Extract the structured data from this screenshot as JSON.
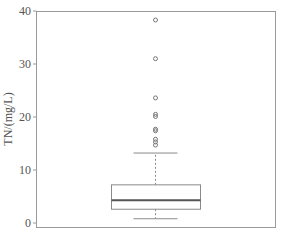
{
  "chart_data": {
    "type": "box",
    "title": "",
    "xlabel": "",
    "ylabel": "TN/(mg/L)",
    "ylim": [
      0,
      40
    ],
    "yticks": [
      0,
      10,
      20,
      30,
      40
    ],
    "ytick_labels": [
      "0",
      "10",
      "20",
      "30",
      "40"
    ],
    "grid": false,
    "legend": null,
    "series": [
      {
        "name": "TN",
        "whisker_low": 0.8,
        "q1": 2.6,
        "median": 4.3,
        "q3": 7.2,
        "whisker_high": 13.2,
        "outliers": [
          14.7,
          15.3,
          15.8,
          17.4,
          17.7,
          20.1,
          20.5,
          23.6,
          31.0,
          38.3
        ]
      }
    ]
  },
  "axis": {
    "ylabel": "TN/(mg/L)",
    "ticks": [
      {
        "value": 0,
        "label": "0"
      },
      {
        "value": 10,
        "label": "10"
      },
      {
        "value": 20,
        "label": "20"
      },
      {
        "value": 30,
        "label": "30"
      },
      {
        "value": 40,
        "label": "40"
      }
    ]
  }
}
